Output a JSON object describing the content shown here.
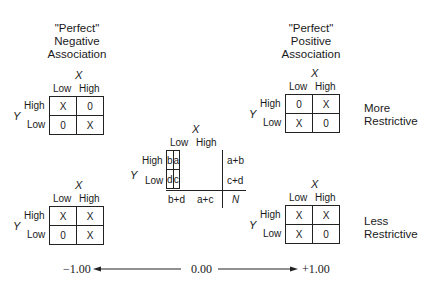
{
  "titles": {
    "negative": [
      "\"Perfect\"",
      "Negative",
      "Association"
    ],
    "positive": [
      "\"Perfect\"",
      "Positive",
      "Association"
    ]
  },
  "side_labels": {
    "more": [
      "More",
      "Restrictive"
    ],
    "less": [
      "Less",
      "Restrictive"
    ]
  },
  "axes": {
    "x_var": "X",
    "y_var": "Y",
    "col_low": "Low",
    "col_high": "High",
    "row_high": "High",
    "row_low": "Low"
  },
  "tables": {
    "top_left": [
      [
        "X",
        "0"
      ],
      [
        "0",
        "X"
      ]
    ],
    "top_right": [
      [
        "0",
        "X"
      ],
      [
        "X",
        "0"
      ]
    ],
    "bottom_left": [
      [
        "X",
        "X"
      ],
      [
        "0",
        "X"
      ]
    ],
    "bottom_right": [
      [
        "X",
        "X"
      ],
      [
        "X",
        "0"
      ]
    ],
    "center": {
      "cells": [
        [
          "b",
          "a"
        ],
        [
          "d",
          "c"
        ]
      ],
      "row_totals": [
        "a+b",
        "c+d"
      ],
      "col_totals": [
        "b+d",
        "a+c"
      ],
      "grand_total": "N"
    }
  },
  "scale": {
    "left": "−1.00",
    "middle": "0.00",
    "right": "+1.00"
  }
}
